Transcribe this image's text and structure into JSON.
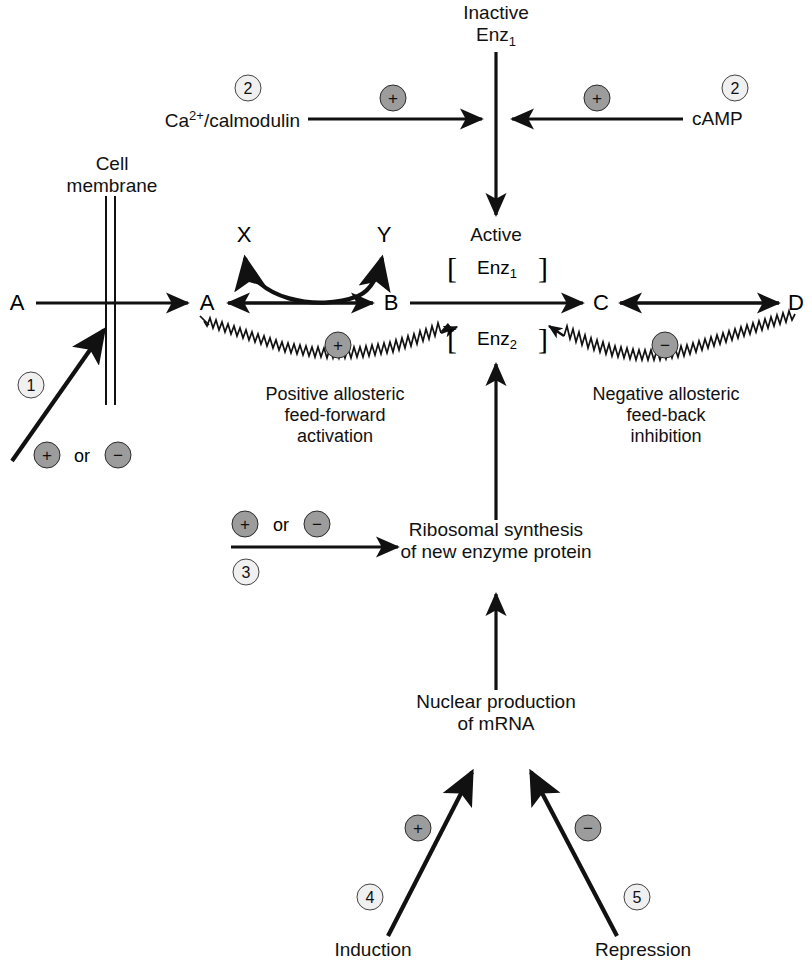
{
  "diagram": {
    "colors": {
      "ink": "#111111",
      "sign_badge_fill": "#9c9c9c",
      "sign_badge_stroke": "#2b2b2b",
      "number_badge_fill": "#f0f0f0",
      "number_badge_stroke": "#444444",
      "background": "#ffffff"
    },
    "nodes": {
      "a_outside": "A",
      "a_inside": "A",
      "b": "B",
      "c": "C",
      "d": "D",
      "x": "X",
      "y": "Y"
    },
    "labels": {
      "inactive_enz1_line1": "Inactive",
      "inactive_enz1_line2": "Enz",
      "inactive_enz1_sub": "1",
      "active": "Active",
      "enz1_text": "Enz",
      "enz1_sub": "1",
      "enz2_text": "Enz",
      "enz2_sub": "2",
      "bracket_left": "[",
      "bracket_right": "]",
      "cell_membrane_line1": "Cell",
      "cell_membrane_line2": "membrane",
      "ca_calmodulin_base": "Ca",
      "ca_calmodulin_sup": "2+",
      "ca_calmodulin_rest": "/calmodulin",
      "camp": "cAMP",
      "positive_allosteric_line1": "Positive allosteric",
      "positive_allosteric_line2": "feed-forward",
      "positive_allosteric_line3": "activation",
      "negative_allosteric_line1": "Negative allosteric",
      "negative_allosteric_line2": "feed-back",
      "negative_allosteric_line3": "inhibition",
      "ribosomal_line1": "Ribosomal synthesis",
      "ribosomal_line2": "of new enzyme protein",
      "nuclear_line1": "Nuclear production",
      "nuclear_line2": "of mRNA",
      "induction": "Induction",
      "repression": "Repression",
      "or_word": "or"
    },
    "badges": {
      "plus": "+",
      "minus": "−",
      "step_1": "1",
      "step_2_left": "2",
      "step_2_right": "2",
      "step_3": "3",
      "step_4": "4",
      "step_5": "5"
    }
  }
}
